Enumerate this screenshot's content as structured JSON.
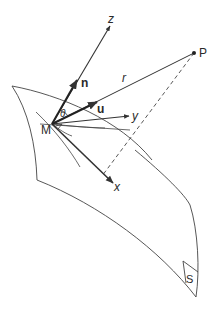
{
  "diagram": {
    "type": "geometry",
    "labels": {
      "point_m": "M",
      "point_p": "P",
      "axis_x": "x",
      "axis_y": "y",
      "axis_z": "z",
      "vector_n": "n",
      "vector_u": "u",
      "distance_r": "r",
      "angle_theta": "θ",
      "surface_s": "S"
    },
    "colors": {
      "stroke": "#333333",
      "text": "#2a2a2a",
      "background": "#ffffff"
    }
  }
}
